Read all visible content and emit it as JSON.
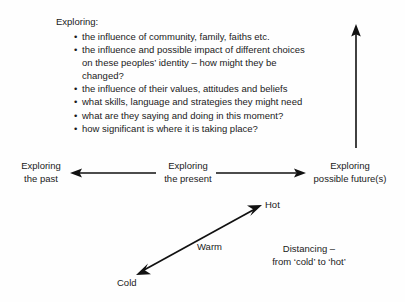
{
  "diagram": {
    "background_color": "#fefefe",
    "ink_color": "#111111"
  },
  "exploring_block": {
    "heading": "Exploring:",
    "bullet_glyph": "•",
    "items": [
      "the influence of community, family, faiths etc.",
      "the influence and possible impact of different choices on these peoples’ identity – how might they be changed?",
      "the influence of their values, attitudes and beliefs",
      "what skills, language and strategies they might need",
      "what are they saying and doing in this moment?",
      "how significant is where it is taking place?"
    ]
  },
  "time_axis": {
    "past": {
      "line1": "Exploring",
      "line2": "the past"
    },
    "present": {
      "line1": "Exploring",
      "line2": "the present"
    },
    "future": {
      "line1": "Exploring",
      "line2": "possible future(s)"
    }
  },
  "thermal_axis": {
    "hot": "Hot",
    "warm": "Warm",
    "cold": "Cold",
    "caption_line1": "Distancing –",
    "caption_line2": "from ‘cold’ to ‘hot’"
  },
  "arrows": {
    "vertical_up": "vertical-up-arrow",
    "left": "left-arrow",
    "right": "right-arrow",
    "diagonal": "diagonal-double-arrow"
  }
}
